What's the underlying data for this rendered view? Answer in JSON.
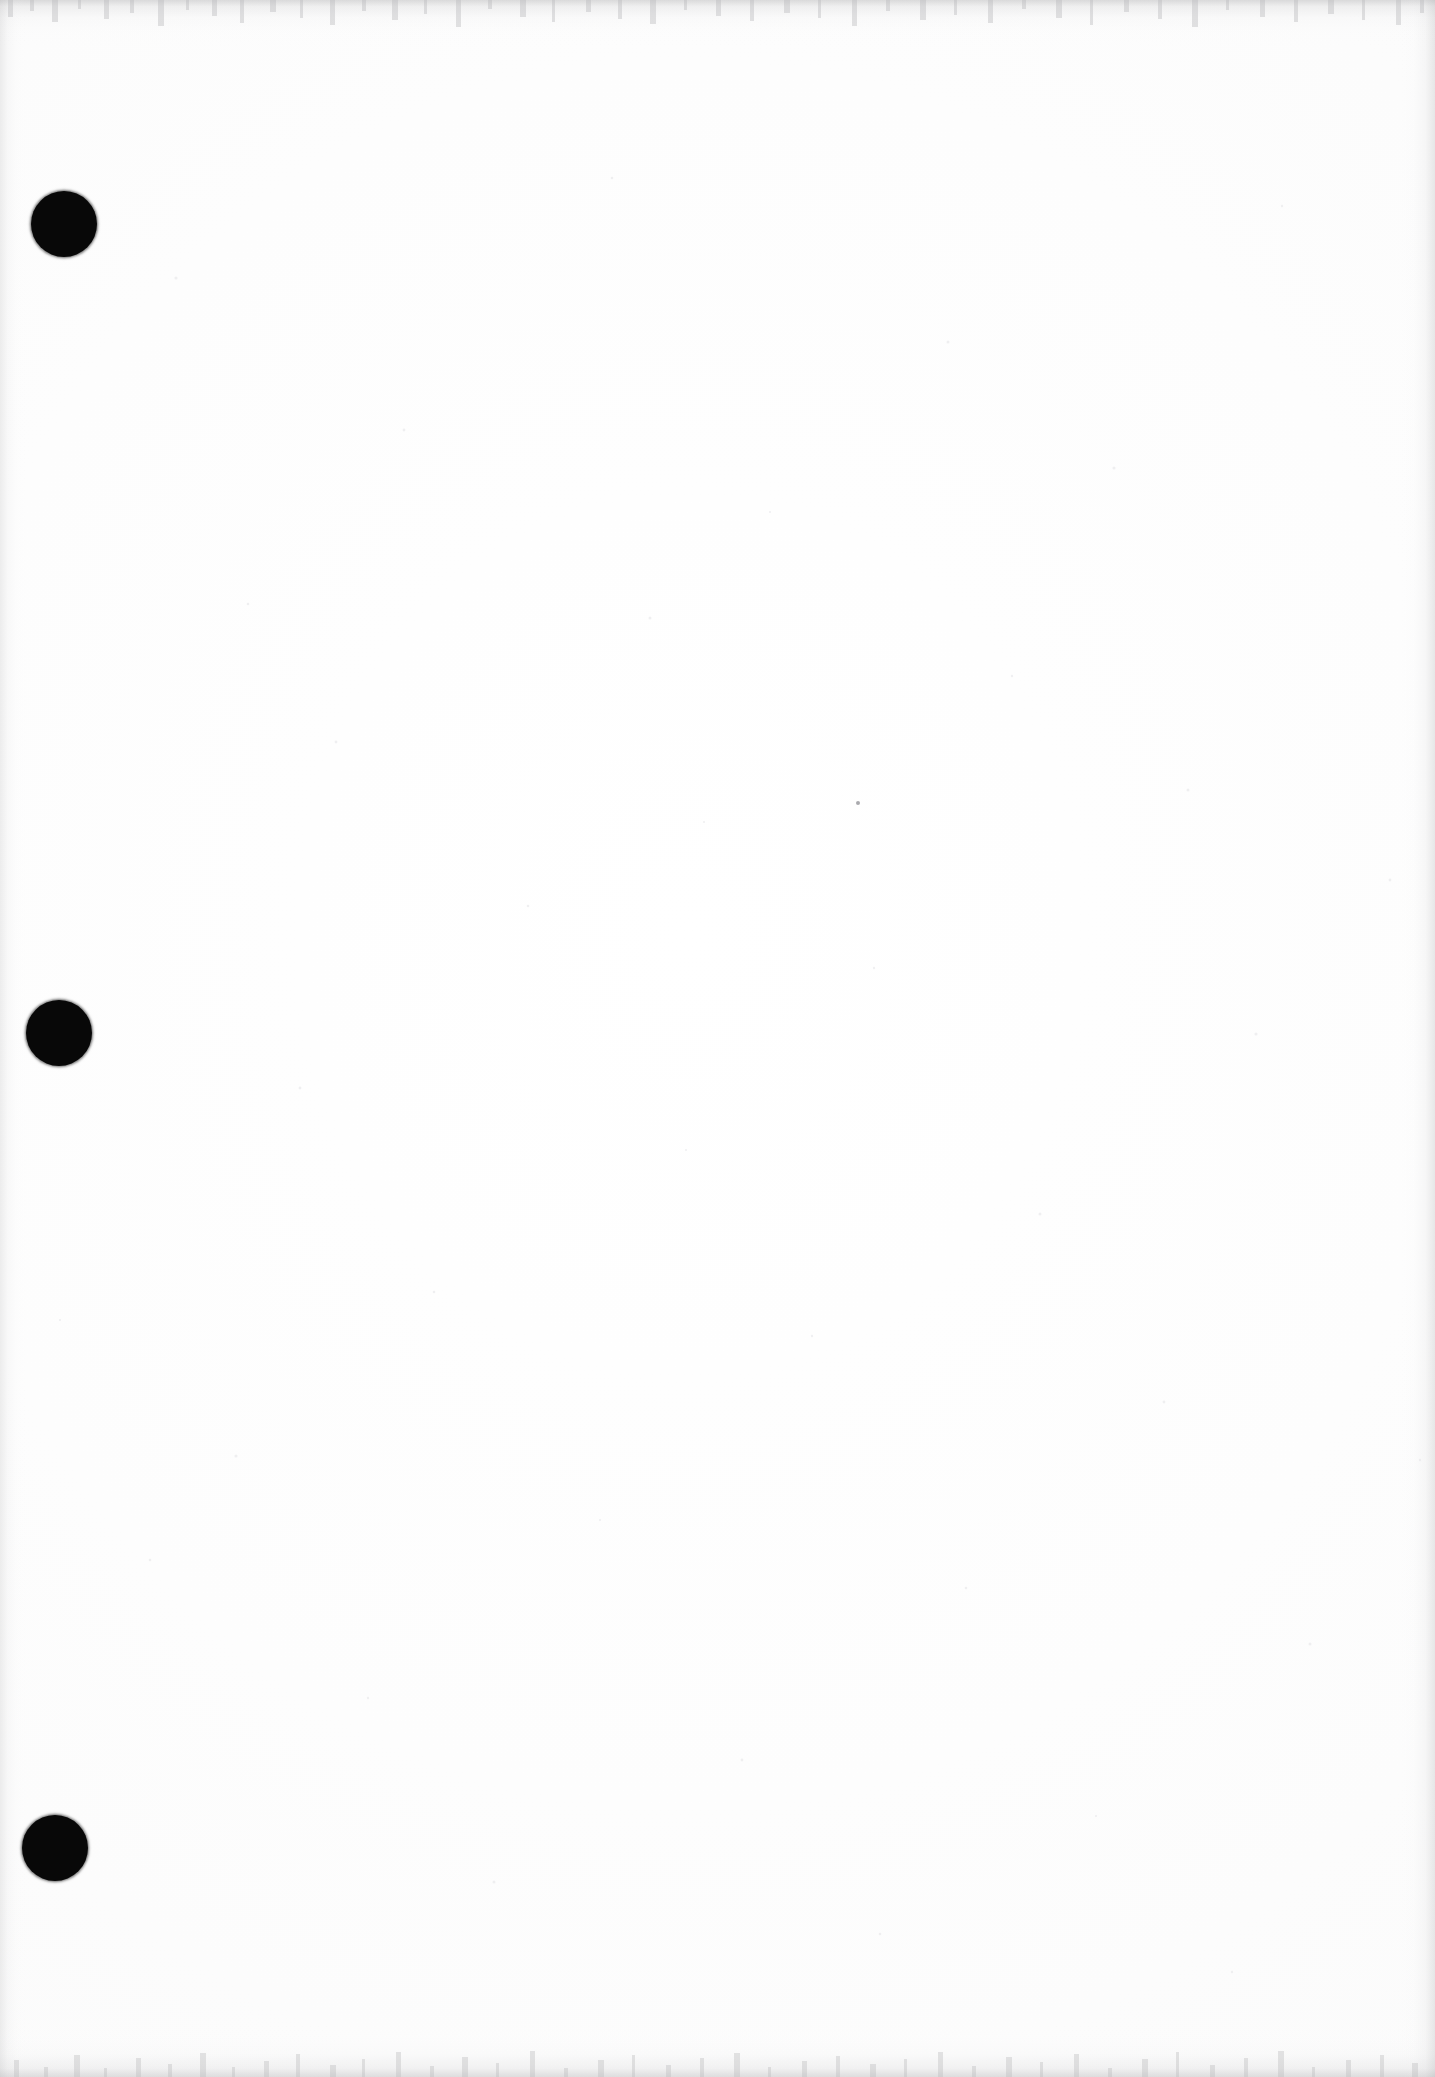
{
  "document": {
    "kind": "scanned-page",
    "content_text": "",
    "page_width": 1435,
    "page_height": 2077,
    "background_color": "#fefefe",
    "ink_color": "#080808",
    "description": "Blank scanned document page with three solid black hole-punch marks in the left margin"
  },
  "marks": {
    "label": "hole-punch-marks",
    "count": 3,
    "color": "#080808",
    "items": [
      {
        "name": "punch-mark-top",
        "cx": 64,
        "cy": 224,
        "r": 33
      },
      {
        "name": "punch-mark-middle",
        "cx": 59,
        "cy": 1033,
        "r": 33
      },
      {
        "name": "punch-mark-bottom",
        "cx": 55,
        "cy": 1848,
        "r": 33
      }
    ]
  },
  "artifacts": {
    "label": "scan-artifacts",
    "specks": [
      {
        "name": "dust-speck",
        "cx": 858,
        "cy": 803,
        "r": 2.2,
        "color": "#8c8c91"
      }
    ],
    "edge_shading": {
      "top_color": "#969698",
      "bottom_color": "#969698",
      "left_color": "#b0b0b2",
      "right_color": "#a8a8aa"
    }
  }
}
